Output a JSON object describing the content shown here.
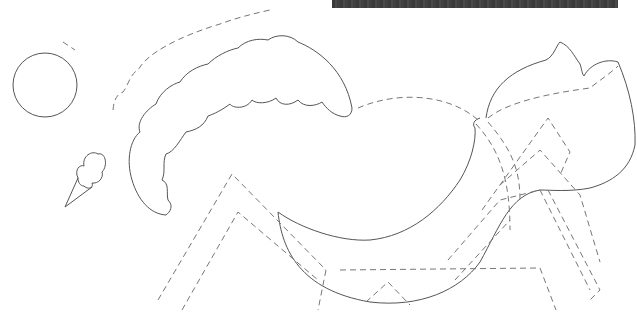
{
  "canvas": {
    "width": 637,
    "height": 320,
    "background": "#ffffff"
  },
  "top_bar": {
    "color": "#3f3f3f"
  },
  "colors": {
    "outline": "#555555",
    "guide": "#777777"
  },
  "shapes": [
    {
      "name": "circle",
      "style": "solid"
    },
    {
      "name": "ice-cream-cone",
      "style": "solid"
    },
    {
      "name": "cloud-arc",
      "style": "solid"
    },
    {
      "name": "body-outline",
      "style": "solid"
    },
    {
      "name": "head-outline",
      "style": "solid"
    },
    {
      "name": "guide-lines",
      "style": "dashed"
    }
  ]
}
